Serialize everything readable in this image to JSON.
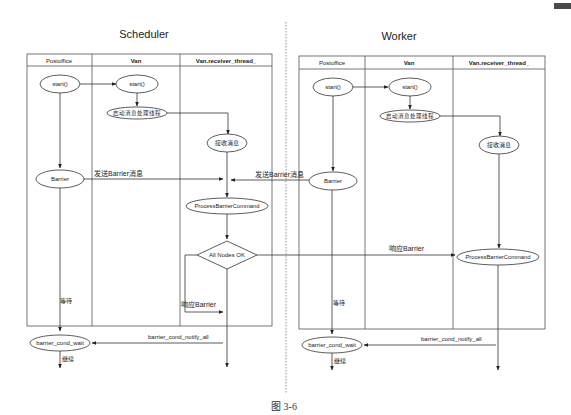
{
  "figure": {
    "caption": "图 3-6"
  },
  "scheduler": {
    "title": "Scheduler",
    "lanes": [
      "Postoffice",
      "Van",
      "Van.receiver_thread_"
    ],
    "nodes": {
      "postoffice_start": "start()",
      "van_start": "start()",
      "start_thread": "启动消息处理线程",
      "receive_msg": "接收消息",
      "barrier": "Barrier",
      "process_barrier": "ProcessBarrierCommand",
      "all_nodes_ok": "All Nodes OK",
      "barrier_wait": "barrier_cond_wait"
    },
    "edge_labels": {
      "send_barrier": "发送Barrier消息",
      "respond_barrier": "响应Barrier",
      "wait": "等待",
      "notify_all": "barrier_cond_notify_all",
      "continue": "继续"
    }
  },
  "worker": {
    "title": "Worker",
    "lanes": [
      "Postoffice",
      "Van",
      "Van.receiver_thread_"
    ],
    "nodes": {
      "postoffice_start": "start()",
      "van_start": "start()",
      "start_thread": "启动消息处理线程",
      "receive_msg": "接收消息",
      "barrier": "Barrier",
      "process_barrier": "ProcessBarrierCommand",
      "barrier_wait": "barrier_cond_wait"
    },
    "edge_labels": {
      "send_barrier": "发送Barrier消息",
      "respond_barrier": "响应Barrier",
      "wait": "等待",
      "notify_all": "barrier_cond_notify_all",
      "continue": "继续"
    }
  }
}
